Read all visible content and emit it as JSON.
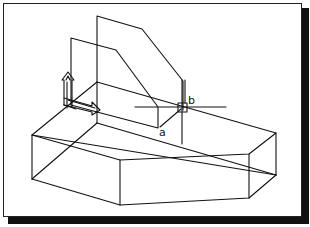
{
  "figure": {
    "type": "isometric wireframe CAD drawing",
    "labels": {
      "a": "a",
      "b": "b"
    },
    "colors": {
      "line": "#111111",
      "background": "#ffffff",
      "shadow": "#111111"
    }
  }
}
